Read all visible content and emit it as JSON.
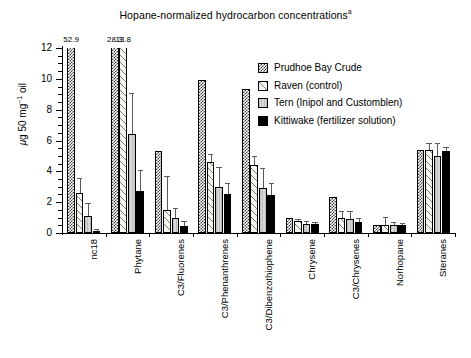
{
  "chart_data": {
    "type": "bar",
    "title": "Hopane-normalized hydrocarbon concentrations",
    "title_superscript": "a",
    "xlabel": "",
    "ylabel": "μg 50 mg⁻¹ oil",
    "ylim": [
      0,
      12
    ],
    "yticks": [
      0,
      2,
      4,
      6,
      8,
      10,
      12
    ],
    "ytick_labels": [
      "0",
      "2",
      "4",
      "6",
      "8",
      "10",
      "12"
    ],
    "grid": false,
    "legend_position": "upper right",
    "categories": [
      "nc18",
      "Phytane",
      "C3/Fluorenes",
      "C3/Phenanthrenes",
      "C3/Dibenzothiophene",
      "Chrysene",
      "C3/Chrysenes",
      "Norhopane",
      "Steranes"
    ],
    "series": [
      {
        "name": "Prudhoe Bay Crude",
        "pattern": "dark-checker",
        "color": "#3a3a3a",
        "values": [
          52.9,
          28.3,
          5.3,
          9.9,
          9.35,
          1.0,
          2.35,
          0.55,
          5.4
        ],
        "errors": [
          0,
          0,
          0,
          0,
          0,
          0,
          0,
          0,
          0
        ],
        "clipped": [
          true,
          true,
          false,
          false,
          false,
          false,
          false,
          false,
          false
        ]
      },
      {
        "name": "Raven (control)",
        "pattern": "light-speckle",
        "color": "#f6f4ef",
        "values": [
          2.6,
          13.8,
          1.5,
          4.6,
          4.4,
          0.75,
          0.95,
          0.5,
          5.4
        ],
        "errors": [
          1.0,
          0,
          2.2,
          0.55,
          0.6,
          0.18,
          0.45,
          0.55,
          0.45
        ],
        "clipped": [
          false,
          true,
          false,
          false,
          false,
          false,
          false,
          false,
          false
        ]
      },
      {
        "name": "Tern (Inipol and Customblen)",
        "pattern": "light-gray",
        "color": "#cfcfcf",
        "values": [
          1.1,
          6.4,
          0.95,
          3.0,
          2.9,
          0.6,
          0.9,
          0.5,
          5.0
        ],
        "errors": [
          0.85,
          2.7,
          0.65,
          1.3,
          1.3,
          0.2,
          0.55,
          0.2,
          0.85
        ],
        "clipped": [
          false,
          false,
          false,
          false,
          false,
          false,
          false,
          false,
          false
        ]
      },
      {
        "name": "Kittiwake (fertilizer solution)",
        "pattern": "solid-black",
        "color": "#000000",
        "values": [
          0.15,
          2.7,
          0.45,
          2.5,
          2.45,
          0.6,
          0.7,
          0.5,
          5.3
        ],
        "errors": [
          0.1,
          1.4,
          0.3,
          0.75,
          0.8,
          0.12,
          0.25,
          0.15,
          0.3
        ],
        "clipped": [
          false,
          false,
          false,
          false,
          false,
          false,
          false,
          false,
          false
        ]
      }
    ],
    "offscale_annotations": [
      {
        "label": "52.9",
        "series": "Prudhoe Bay Crude",
        "category": "nc18"
      },
      {
        "label": "28.3",
        "series": "Prudhoe Bay Crude",
        "category": "Phytane"
      },
      {
        "label": "13.8",
        "series": "Raven (control)",
        "category": "Phytane"
      }
    ]
  },
  "legend": {
    "items": [
      {
        "label": "Prudhoe Bay Crude"
      },
      {
        "label": "Raven (control)"
      },
      {
        "label": "Tern (Inipol and Customblen)"
      },
      {
        "label": "Kittiwake (fertilizer solution)"
      }
    ]
  }
}
